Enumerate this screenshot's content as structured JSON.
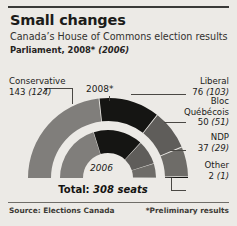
{
  "title": "Small changes",
  "subtitle": "Canada’s House of Commons election results",
  "parliament_line_main": "Parliament, 2008*",
  "parliament_line_paren": "(2006)",
  "ring_labels": {
    "outer": "2008*",
    "inner": "2006"
  },
  "labels": {
    "conservative": {
      "name": "Conservative",
      "value": "143",
      "prev": "(124)"
    },
    "liberal": {
      "name": "Liberal",
      "value": "76",
      "prev": "(103)"
    },
    "bloc": {
      "name": "Bloc",
      "name2": "Québécois",
      "value": "50",
      "prev": "(51)"
    },
    "ndp": {
      "name": "NDP",
      "value": "37",
      "prev": "(29)"
    },
    "other": {
      "name": "Other",
      "value": "2",
      "prev": "(1)"
    }
  },
  "total": {
    "prefix": "Total:",
    "value": "308 seats"
  },
  "source": "Source: Elections Canada",
  "footnote": "*Preliminary results",
  "colors": {
    "background": "#eceae6",
    "conservative": "#807e7b",
    "liberal": "#151513",
    "bloc": "#5f5d5a",
    "ndp": "#6e6c68",
    "other": "#151513",
    "leader_line": "#4a4844",
    "rule": "#3a3a38"
  },
  "chart_data": {
    "type": "pie",
    "title": "Canada’s House of Commons election results",
    "subtype": "nested-semicircle-donut",
    "total_seats": 308,
    "legend_position": "outside-leader-lines",
    "series": [
      {
        "name": "2008*",
        "ring": "outer",
        "categories": [
          "Conservative",
          "Liberal",
          "Bloc Québécois",
          "NDP",
          "Other"
        ],
        "values": [
          143,
          76,
          50,
          37,
          2
        ],
        "colors": [
          "#807e7b",
          "#151513",
          "#5f5d5a",
          "#6e6c68",
          "#151513"
        ]
      },
      {
        "name": "2006",
        "ring": "inner",
        "categories": [
          "Conservative",
          "Liberal",
          "Bloc Québécois",
          "NDP",
          "Other"
        ],
        "values": [
          124,
          103,
          51,
          29,
          1
        ],
        "colors": [
          "#807e7b",
          "#151513",
          "#5f5d5a",
          "#6e6c68",
          "#151513"
        ]
      }
    ]
  }
}
